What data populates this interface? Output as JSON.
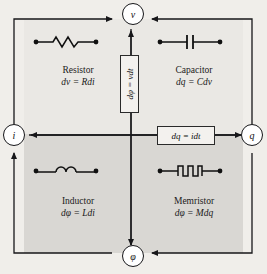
{
  "diagram": {
    "background_color": "#f0eeea",
    "quadrant_light": "#eae8e4",
    "quadrant_dark": "#d9d7d3",
    "line_color": "#17171a"
  },
  "nodes": [
    {
      "id": "v",
      "label": "v",
      "name": "voltage"
    },
    {
      "id": "i",
      "label": "i",
      "name": "current"
    },
    {
      "id": "q",
      "label": "q",
      "name": "charge"
    },
    {
      "id": "phi",
      "label": "φ",
      "name": "flux"
    }
  ],
  "quadrants": [
    {
      "id": "resistor",
      "name": "Resistor",
      "equation": "dv = Rdi",
      "symbol": "resistor-symbol"
    },
    {
      "id": "capacitor",
      "name": "Capacitor",
      "equation": "dq = Cdv",
      "symbol": "capacitor-symbol"
    },
    {
      "id": "inductor",
      "name": "Inductor",
      "equation": "dφ = Ldi",
      "symbol": "inductor-symbol"
    },
    {
      "id": "memristor",
      "name": "Memristor",
      "equation": "dφ = Mdq",
      "symbol": "memristor-symbol"
    }
  ],
  "relations": {
    "vertical": {
      "equation": "dφ = vdt",
      "orientation": "rotated-90"
    },
    "horizontal": {
      "equation": "dq = idt",
      "orientation": "horizontal"
    }
  }
}
